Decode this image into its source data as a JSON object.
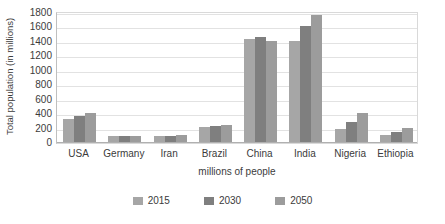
{
  "chart_data": {
    "type": "bar",
    "title": "",
    "subtitle": "",
    "xlabel": "millions of people",
    "ylabel": "Total population (in millions)",
    "categories": [
      "USA",
      "Germany",
      "Iran",
      "Brazil",
      "China",
      "India",
      "Nigeria",
      "Ethiopia"
    ],
    "series": [
      {
        "name": "2015",
        "color": "#a6a6a6",
        "values": [
          325,
          81,
          79,
          208,
          1420,
          1400,
          182,
          99
        ]
      },
      {
        "name": "2030",
        "color": "#7f7f7f",
        "values": [
          360,
          82,
          88,
          225,
          1450,
          1600,
          273,
          140
        ]
      },
      {
        "name": "2050",
        "color": "#9c9c9c",
        "values": [
          400,
          79,
          100,
          238,
          1400,
          1760,
          398,
          188
        ]
      }
    ],
    "ylim": [
      0,
      1800
    ],
    "ytick_step": 200,
    "yticks": [
      "1800",
      "1600",
      "1400",
      "1200",
      "1000",
      "800",
      "600",
      "400",
      "200",
      "0"
    ],
    "grid": true,
    "grid_axis": "y",
    "legend_position": "bottom",
    "plot_border_color": "#d9d9d9",
    "gridline_color": "#e2e2e2",
    "text_color": "#3b3b3b",
    "background": "#ffffff"
  }
}
